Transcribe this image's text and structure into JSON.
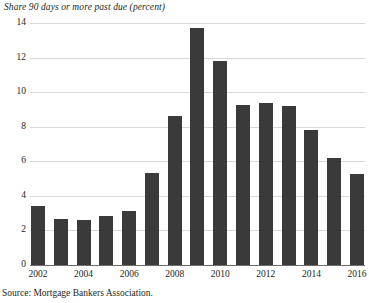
{
  "chart_data": {
    "type": "bar",
    "title": "Share 90 days or more past due (percent)",
    "xlabel": "",
    "ylabel": "",
    "ylim": [
      0,
      14
    ],
    "ytick_step": 2,
    "yticks": [
      "0",
      "2",
      "4",
      "6",
      "8",
      "10",
      "12",
      "14"
    ],
    "grid": true,
    "legend": "none",
    "categories": [
      "2002",
      "2003",
      "2004",
      "2005",
      "2006",
      "2007",
      "2008",
      "2009",
      "2010",
      "2011",
      "2012",
      "2013",
      "2014",
      "2015",
      "2016"
    ],
    "xtick_labels": [
      "2002",
      "2004",
      "2006",
      "2008",
      "2010",
      "2012",
      "2014",
      "2016"
    ],
    "values": [
      3.4,
      2.65,
      2.6,
      2.85,
      3.1,
      5.3,
      8.6,
      13.7,
      11.8,
      9.25,
      9.35,
      9.2,
      7.8,
      6.2,
      5.25
    ],
    "bar_color": "#3a3a3a",
    "gridline_color": "#d9d9d9",
    "axis_color": "#6d6d6d",
    "source": "Source: Mortgage Bankers Association."
  }
}
